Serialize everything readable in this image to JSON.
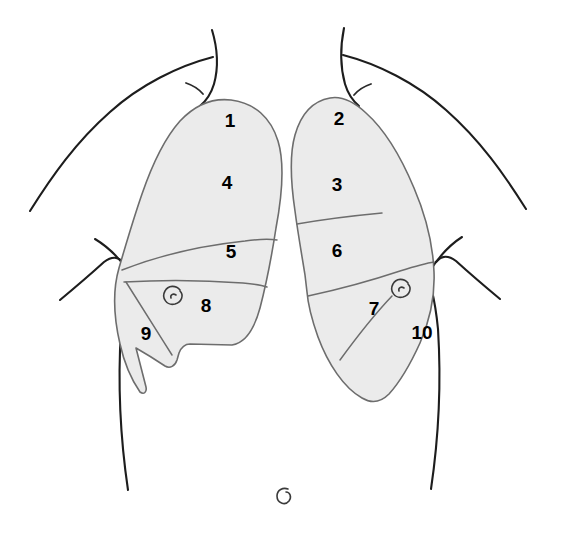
{
  "diagram": {
    "view": "anterior",
    "fill_color": "#ebebeb",
    "outline_color": "#1d1d1d",
    "lung_stroke_color": "#6d6d6d",
    "label_color": "#000000"
  },
  "sites": [
    {
      "id": "site-1",
      "label": "1",
      "x": 230,
      "y": 122,
      "lung": "left-lung-field",
      "zone": "apex"
    },
    {
      "id": "site-2",
      "label": "2",
      "x": 339,
      "y": 120,
      "lung": "right-lung-field",
      "zone": "apex"
    },
    {
      "id": "site-3",
      "label": "3",
      "x": 337,
      "y": 186,
      "lung": "right-lung-field",
      "zone": "upper"
    },
    {
      "id": "site-4",
      "label": "4",
      "x": 227,
      "y": 184,
      "lung": "left-lung-field",
      "zone": "upper"
    },
    {
      "id": "site-5",
      "label": "5",
      "x": 231,
      "y": 253,
      "lung": "left-lung-field",
      "zone": "middle"
    },
    {
      "id": "site-6",
      "label": "6",
      "x": 337,
      "y": 252,
      "lung": "right-lung-field",
      "zone": "middle"
    },
    {
      "id": "site-7",
      "label": "7",
      "x": 374,
      "y": 310,
      "lung": "right-lung-field",
      "zone": "lower-medial"
    },
    {
      "id": "site-8",
      "label": "8",
      "x": 206,
      "y": 307,
      "lung": "left-lung-field",
      "zone": "lower-medial"
    },
    {
      "id": "site-9",
      "label": "9",
      "x": 146,
      "y": 335,
      "lung": "left-lung-field",
      "zone": "lower-lateral"
    },
    {
      "id": "site-10",
      "label": "10",
      "x": 422,
      "y": 334,
      "lung": "right-lung-field",
      "zone": "lower-lateral"
    }
  ],
  "landmarks": [
    {
      "id": "nipple-left",
      "name": "nipple-marker",
      "x": 173,
      "y": 295
    },
    {
      "id": "nipple-right",
      "name": "nipple-marker",
      "x": 400,
      "y": 288
    },
    {
      "id": "navel",
      "name": "navel-marker",
      "x": 283,
      "y": 497
    }
  ]
}
